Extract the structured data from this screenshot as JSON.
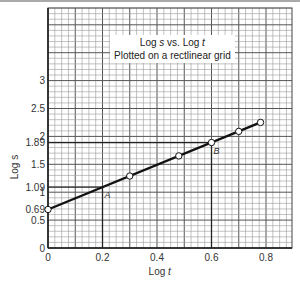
{
  "chart_data": {
    "type": "line",
    "title": "Log s vs. Log t",
    "subtitle": "Plotted on a rectlinear grid",
    "xlabel": "Log t",
    "ylabel": "Log s",
    "xlim": [
      0,
      0.9
    ],
    "ylim": [
      0,
      4.3
    ],
    "grid": true,
    "x_ticks": [
      "0",
      "0.2",
      "0.4",
      "0.6",
      "0.8"
    ],
    "y_ticks": [
      "0",
      "0.5",
      "0.69",
      "1",
      "1.09",
      "1.5",
      "1.89",
      "2",
      "2.5",
      "3"
    ],
    "series": [
      {
        "name": "Log s vs Log t",
        "points": [
          {
            "x": 0.0,
            "y": 0.69
          },
          {
            "x": 0.3,
            "y": 1.29
          },
          {
            "x": 0.48,
            "y": 1.65
          },
          {
            "x": 0.6,
            "y": 1.89
          },
          {
            "x": 0.7,
            "y": 2.09
          },
          {
            "x": 0.78,
            "y": 2.25
          }
        ]
      }
    ],
    "annotations": [
      {
        "label": "A",
        "x": 0.2,
        "y": 1.09
      },
      {
        "label": "B",
        "x": 0.6,
        "y": 1.89
      }
    ],
    "reference_lines": [
      {
        "orientation": "horizontal",
        "y": 1.09,
        "x_to": 0.2
      },
      {
        "orientation": "vertical",
        "x": 0.2,
        "y_to": 1.09
      },
      {
        "orientation": "horizontal",
        "y": 1.89,
        "x_to": 0.6
      },
      {
        "orientation": "vertical",
        "x": 0.6,
        "y_to": 1.89
      }
    ]
  },
  "title_box": {
    "line1_prefix": "Log ",
    "line1_s": "s",
    "line1_mid": "  vs. Log ",
    "line1_t": "t",
    "line2": "Plotted on a rectlinear grid"
  },
  "labels": {
    "point_a": "A",
    "point_b": "B",
    "xlabel_prefix": "Log ",
    "xlabel_var": "t",
    "ylabel": "Log s"
  }
}
